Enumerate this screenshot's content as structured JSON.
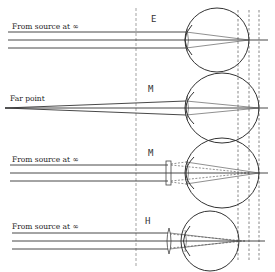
{
  "diagram": {
    "panels": [
      {
        "id": "emmetropia",
        "source_label": "From source at ∞",
        "eye_label": "E",
        "correction": "none",
        "focus": "on-retina"
      },
      {
        "id": "myopia-far-point",
        "source_label": "Far point",
        "eye_label": "M",
        "correction": "none",
        "focus": "on-retina"
      },
      {
        "id": "myopia-corrected",
        "source_label": "From source at ∞",
        "eye_label": "M",
        "correction": "concave-lens",
        "focus": "on-retina"
      },
      {
        "id": "hyperopia-corrected",
        "source_label": "From source at ∞",
        "eye_label": "H",
        "correction": "convex-lens",
        "focus": "on-retina"
      }
    ],
    "colors": {
      "ink": "#333333",
      "background": "#ffffff"
    }
  }
}
